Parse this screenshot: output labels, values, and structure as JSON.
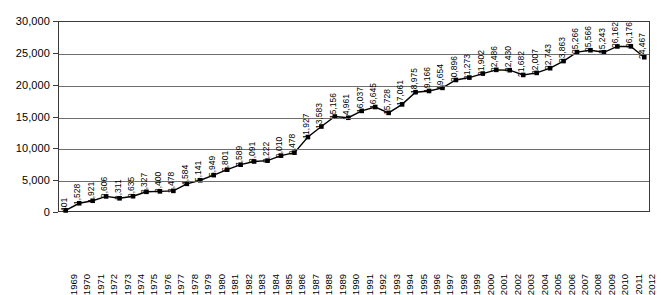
{
  "chart_data": {
    "type": "line",
    "title": "",
    "subtitle": "",
    "xlabel": "",
    "ylabel": "",
    "grid": true,
    "legend": false,
    "legend_position": "none",
    "marker": "square",
    "marker_color": "#000000",
    "line_color": "#000000",
    "show_point_labels": true,
    "point_label_rotation": -90,
    "xlim": [
      "1969",
      "2012"
    ],
    "ylim": [
      0,
      30000
    ],
    "ytick_step": 5000,
    "ytick_labels": [
      "30,000",
      "25,000",
      "20,000",
      "15,000",
      "10,000",
      "5,000",
      "0"
    ],
    "ytick_values": [
      30000,
      25000,
      20000,
      15000,
      10000,
      5000,
      0
    ],
    "categories": [
      "1969",
      "1970",
      "1971",
      "1972",
      "1973",
      "1974",
      "1975",
      "1976",
      "1977",
      "1978",
      "1979",
      "1980",
      "1981",
      "1982",
      "1983",
      "1984",
      "1985",
      "1986",
      "1987",
      "1988",
      "1989",
      "1990",
      "1991",
      "1992",
      "1993",
      "1994",
      "1995",
      "1996",
      "1997",
      "1998",
      "1999",
      "2000",
      "2001",
      "2002",
      "2003",
      "2004",
      "2005",
      "2006",
      "2007",
      "2008",
      "2009",
      "2010",
      "2011",
      "2012"
    ],
    "values": [
      401,
      1528,
      1921,
      2606,
      2311,
      2635,
      3327,
      3400,
      3478,
      4584,
      5141,
      5949,
      6801,
      7589,
      8091,
      8222,
      9010,
      9478,
      11927,
      13583,
      15156,
      14961,
      16037,
      16645,
      15728,
      17061,
      18975,
      19166,
      19654,
      20896,
      21273,
      21902,
      22486,
      22430,
      21682,
      22007,
      22743,
      23863,
      25266,
      25566,
      25243,
      26162,
      26176,
      24467
    ],
    "value_labels": [
      "401",
      "1,528",
      "1,921",
      "2,606",
      "2,311",
      "2,635",
      "3,327",
      "3,400",
      "3,478",
      "4,584",
      "5,141",
      "5,949",
      "6,801",
      "7,589",
      "8,091",
      "8,222",
      "9,010",
      "9,478",
      "11,927",
      "13,583",
      "15,156",
      "14,961",
      "16,037",
      "16,645",
      "15,728",
      "17,061",
      "18,975",
      "19,166",
      "19,654",
      "20,896",
      "21,273",
      "21,902",
      "22,486",
      "22,430",
      "21,682",
      "22,007",
      "22,743",
      "23,863",
      "25,266",
      "25,566",
      "25,243",
      "26,162",
      "26,176",
      "24,467"
    ]
  }
}
